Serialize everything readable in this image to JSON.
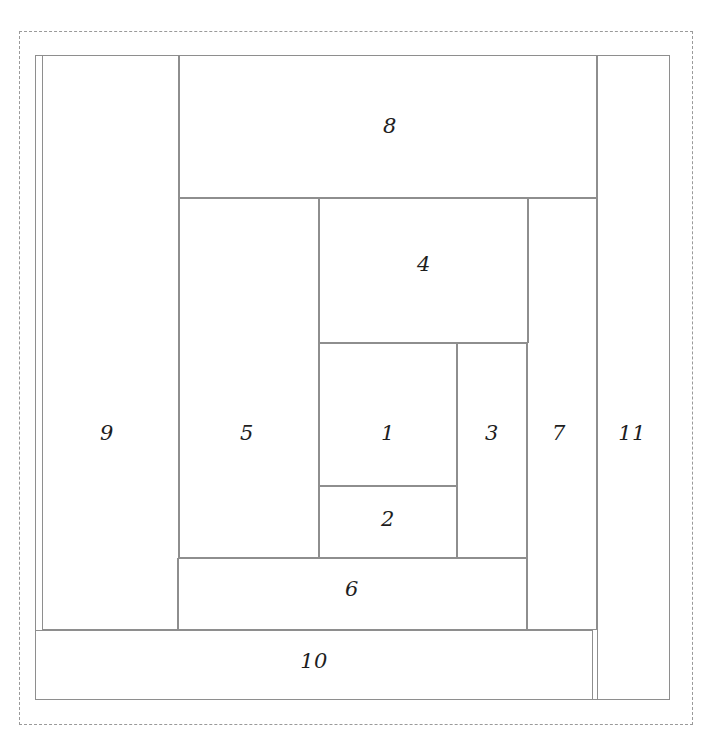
{
  "document": {
    "title": "Log Cabin Foundation Paper Piecing Block",
    "width": 714,
    "height": 745,
    "background_color": "#ffffff"
  },
  "colors": {
    "line": "#8e8e8e",
    "seam_line": "#9a9a9a",
    "label_text": "#1e1e1e",
    "paper": "#ffffff"
  },
  "seam_allowance": {
    "name": "seam-allowance-boundary",
    "style": "dashed",
    "x": 19,
    "y": 31,
    "width": 674,
    "height": 694
  },
  "block_outline": {
    "name": "block-outline",
    "style": "solid",
    "x": 35,
    "y": 55,
    "width": 635,
    "height": 645
  },
  "pieces": [
    {
      "number": "1",
      "name": "piece-1",
      "x": 319,
      "y": 343,
      "width": 138,
      "height": 143,
      "label_x": 388,
      "label_y": 433
    },
    {
      "number": "2",
      "name": "piece-2",
      "x": 319,
      "y": 486,
      "width": 138,
      "height": 72,
      "label_x": 388,
      "label_y": 519
    },
    {
      "number": "3",
      "name": "piece-3",
      "x": 457,
      "y": 343,
      "width": 70,
      "height": 215,
      "label_x": 492,
      "label_y": 433
    },
    {
      "number": "4",
      "name": "piece-4",
      "x": 319,
      "y": 198,
      "width": 210,
      "height": 145,
      "label_x": 424,
      "label_y": 264
    },
    {
      "number": "5",
      "name": "piece-5",
      "x": 179,
      "y": 198,
      "width": 140,
      "height": 360,
      "label_x": 247,
      "label_y": 433
    },
    {
      "number": "6",
      "name": "piece-6",
      "x": 177,
      "y": 558,
      "width": 350,
      "height": 72,
      "label_x": 352,
      "label_y": 589
    },
    {
      "number": "7",
      "name": "piece-7",
      "x": 527,
      "y": 198,
      "width": 70,
      "height": 432,
      "label_x": 559,
      "label_y": 433
    },
    {
      "number": "8",
      "name": "piece-8",
      "x": 179,
      "y": 55,
      "width": 418,
      "height": 143,
      "label_x": 390,
      "label_y": 126
    },
    {
      "number": "9",
      "name": "piece-9",
      "x": 42,
      "y": 55,
      "width": 137,
      "height": 575,
      "label_x": 107,
      "label_y": 433
    },
    {
      "number": "10",
      "name": "piece-10",
      "x": 35,
      "y": 630,
      "width": 558,
      "height": 70,
      "label_x": 314,
      "label_y": 661
    },
    {
      "number": "11",
      "name": "piece-11",
      "x": 597,
      "y": 55,
      "width": 73,
      "height": 645,
      "label_x": 632,
      "label_y": 433
    }
  ]
}
